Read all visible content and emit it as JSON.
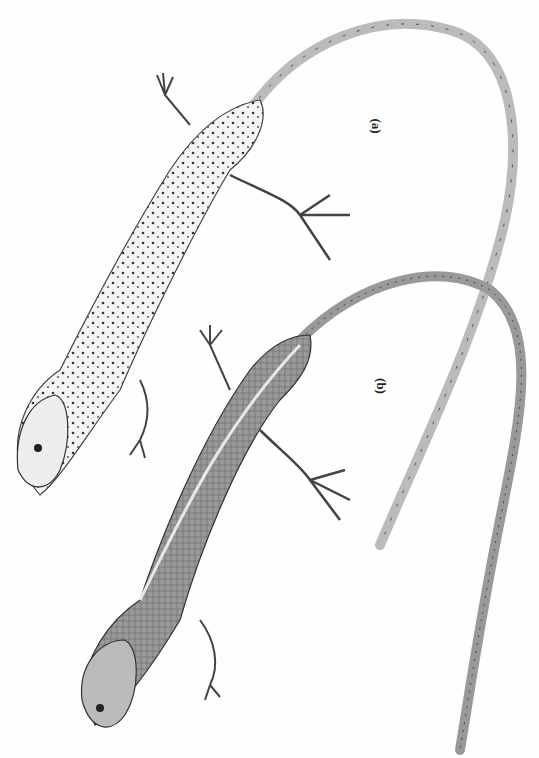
{
  "figure": {
    "labels": [
      {
        "id": "a",
        "text": "(a)"
      },
      {
        "id": "b",
        "text": "(b)"
      }
    ],
    "subjects": [
      {
        "label": "a",
        "description": "spotted lizard, pale body with dark speckles, long tail curving upward and down to right"
      },
      {
        "label": "b",
        "description": "striped lizard, darker body with pale dorsolateral stripe, long tail curving upward and down"
      }
    ]
  }
}
